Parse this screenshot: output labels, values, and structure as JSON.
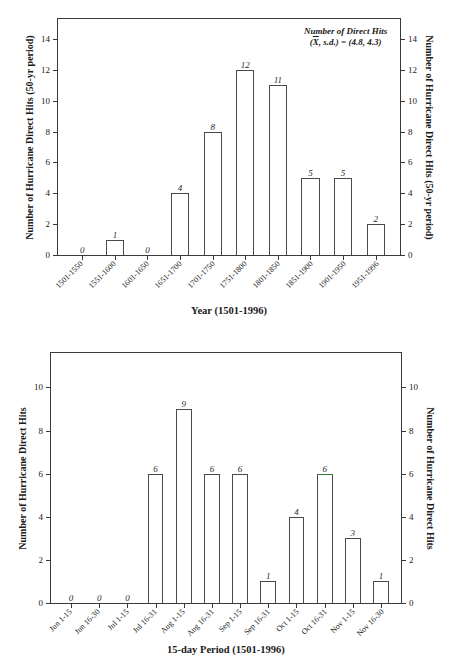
{
  "figure1": {
    "annotation_line1": "Number of Direct Hits",
    "annotation_line2_pre": "(",
    "annotation_xbar": "X",
    "annotation_line2_post": ", s.d.) = (4.8, 4.3)",
    "ylabel_left": "Number of  Hurricane Direct Hits (50-yr period)",
    "ylabel_right": "Number of  Hurricane Direct Hits (50-yr period)",
    "xlabel": "Year (1501-1996)"
  },
  "figure2": {
    "ylabel_left": "Number of Hurricane Direct Hits",
    "ylabel_right": "Number of Hurricane Direct Hits",
    "xlabel": "15-day Period (1501-1996)"
  },
  "chart_data": [
    {
      "type": "bar",
      "title": "",
      "xlabel": "Year (1501-1996)",
      "ylabel": "Number of  Hurricane Direct Hits (50-yr period)",
      "ylabel_right": "Number of  Hurricane Direct Hits (50-yr period)",
      "categories": [
        "1501-1550",
        "1551-1600",
        "1601-1650",
        "1651-1700",
        "1701-1750",
        "1751-1800",
        "1801-1850",
        "1851-1900",
        "1901-1950",
        "1951-1996"
      ],
      "values": [
        0,
        1,
        0,
        4,
        8,
        12,
        11,
        5,
        5,
        2
      ],
      "data_labels": [
        "0",
        "1",
        "0",
        "4",
        "8",
        "12",
        "11",
        "5",
        "5",
        "2"
      ],
      "yticks": [
        0,
        2,
        4,
        6,
        8,
        10,
        12,
        14
      ],
      "ylim": [
        0,
        15.3
      ],
      "grid": false,
      "legend": "none",
      "annotation": "Number of Direct Hits (X, s.d.) = (4.8, 4.3)",
      "mean": 4.8,
      "sd": 4.3
    },
    {
      "type": "bar",
      "title": "",
      "xlabel": "15-day Period (1501-1996)",
      "ylabel": "Number of Hurricane Direct Hits",
      "ylabel_right": "Number of Hurricane Direct Hits",
      "categories": [
        "Jun 1-15",
        "Jun 16-30",
        "Jul 1-15",
        "Jul 16-31",
        "Aug 1-15",
        "Aug 16-31",
        "Sep 1-15",
        "Sep 16-31",
        "Oct 1-15",
        "Oct 16-31",
        "Nov 1-15",
        "Nov 16-30"
      ],
      "values": [
        0,
        0,
        0,
        6,
        9,
        6,
        6,
        1,
        4,
        6,
        3,
        1
      ],
      "data_labels": [
        "0",
        "0",
        "0",
        "6",
        "9",
        "6",
        "6",
        "1",
        "4",
        "6",
        "3",
        "1"
      ],
      "yticks": [
        0,
        2,
        4,
        6,
        8,
        10
      ],
      "ylim": [
        0,
        11.6
      ],
      "grid": false,
      "legend": "none"
    }
  ],
  "colors": {
    "axis": "#3a3a3a",
    "bar_stroke": "#4a4a4a",
    "bar_fill": "#ffffff",
    "text": "#1a1a1a",
    "accent_green": "#2f7d32"
  }
}
